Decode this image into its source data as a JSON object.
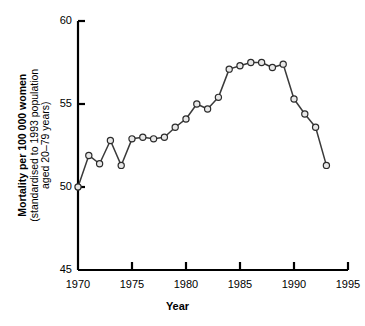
{
  "chart_data": {
    "type": "line",
    "title": "",
    "xlabel": "Year",
    "ylabel": "Mortality per 100 000 women (standardised to 1993 population aged 20–79 years)",
    "ylabel_lines": [
      "Mortality per 100 000 women",
      "(standardised to 1993 population",
      "aged 20–79 years)"
    ],
    "xlim": [
      1970,
      1995
    ],
    "ylim": [
      45,
      60
    ],
    "xticks": [
      1970,
      1975,
      1980,
      1985,
      1990,
      1995
    ],
    "xtick_labels": [
      "1970",
      "1975",
      "1980",
      "1985",
      "1990",
      "1995"
    ],
    "yticks": [
      45,
      50,
      55,
      60
    ],
    "ytick_labels": [
      "45",
      "50",
      "55",
      "60"
    ],
    "grid": false,
    "legend": null,
    "marker": "open-circle",
    "line_color": "#3a3a3a",
    "marker_fill": "#e8e8e8",
    "marker_stroke": "#2b2b2b",
    "axis_color": "#000000",
    "x": [
      1970,
      1971,
      1972,
      1973,
      1974,
      1975,
      1976,
      1977,
      1978,
      1979,
      1980,
      1981,
      1982,
      1983,
      1984,
      1985,
      1986,
      1987,
      1988,
      1989,
      1990,
      1991,
      1992,
      1993
    ],
    "values": [
      50.0,
      51.9,
      51.4,
      52.8,
      51.3,
      52.9,
      53.0,
      52.9,
      53.0,
      53.6,
      54.1,
      55.0,
      54.7,
      55.4,
      57.1,
      57.3,
      57.5,
      57.5,
      57.2,
      57.4,
      55.3,
      54.4,
      53.6,
      51.3
    ],
    "series": [
      {
        "name": "Mortality",
        "values": [
          50.0,
          51.9,
          51.4,
          52.8,
          51.3,
          52.9,
          53.0,
          52.9,
          53.0,
          53.6,
          54.1,
          55.0,
          54.7,
          55.4,
          57.1,
          57.3,
          57.5,
          57.5,
          57.2,
          57.4,
          55.3,
          54.4,
          53.6,
          51.3
        ]
      }
    ]
  }
}
